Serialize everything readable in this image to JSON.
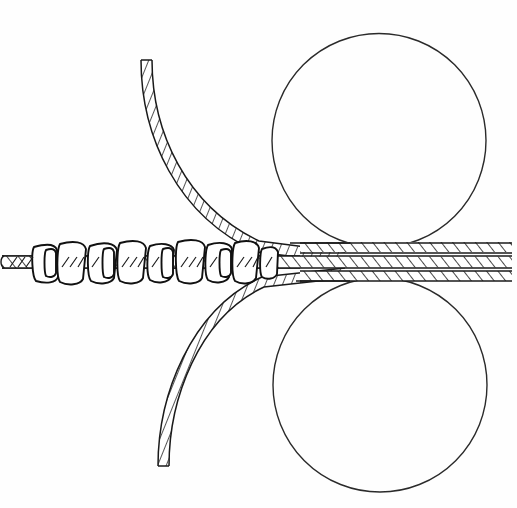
{
  "figure": {
    "background_color": "#fefefe",
    "line_color": "#1a1a1a",
    "width": 517,
    "height": 508,
    "caption": ""
  },
  "rollers": [
    {
      "name": "upper-roller",
      "label": "upper roller",
      "cx": 379,
      "cy": 140.5,
      "r": 107,
      "stroke": "#2a2a2a"
    },
    {
      "name": "lower-roller",
      "label": "lower roller",
      "cx": 380,
      "cy": 385,
      "r": 107,
      "stroke": "#2a2a2a"
    }
  ],
  "strands": {
    "upper_curve": {
      "name": "upper-incoming-strand",
      "label": "upper incoming strand",
      "start": [
        158,
        60
      ],
      "end": [
        330,
        250
      ],
      "thickness": 11,
      "hatch": "diagonal"
    },
    "lower_curve": {
      "name": "lower-incoming-strand",
      "label": "lower incoming strand",
      "start": [
        164,
        466
      ],
      "end": [
        330,
        274
      ],
      "thickness": 11,
      "hatch": "diagonal"
    },
    "core_strand": {
      "name": "core-strand",
      "label": "core strand",
      "left_end": 2,
      "right_end": 512,
      "center_y": 262,
      "thickness": 13,
      "hatch": "diagonal"
    },
    "output_bands": [
      {
        "name": "output-band-top",
        "label": "top band",
        "y": 247,
        "thickness": 10
      },
      {
        "name": "output-band-middle",
        "label": "middle band",
        "y": 262,
        "thickness": 11
      },
      {
        "name": "output-band-bottom",
        "label": "bottom band",
        "y": 276,
        "thickness": 10
      }
    ]
  },
  "coils": {
    "name": "wrapped-coils",
    "label": "wrapped coil windings",
    "count": 12,
    "x_start": 30,
    "x_end": 281,
    "top": 242,
    "bottom": 283,
    "positions": [
      32,
      54,
      76,
      97,
      118,
      139,
      160,
      181,
      201,
      222,
      243,
      263
    ]
  },
  "annotations": []
}
